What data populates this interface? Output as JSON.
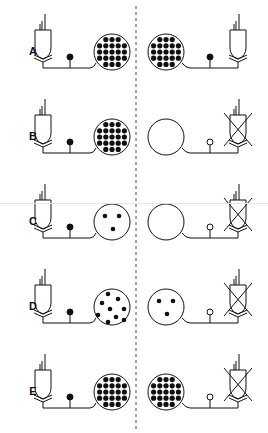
{
  "figure": {
    "colors": {
      "ink": "#111111",
      "divider": "#555555",
      "background": "#ffffff"
    },
    "divider": {
      "x": 136,
      "style": "dashed"
    },
    "rows": [
      {
        "label": "A",
        "y": 52,
        "left": {
          "cell_pattern": "dense",
          "synapse": "filled",
          "bulb": "intact"
        },
        "right": {
          "cell_pattern": "dense",
          "synapse": "filled",
          "bulb": "intact"
        }
      },
      {
        "label": "B",
        "y": 137,
        "left": {
          "cell_pattern": "dense",
          "synapse": "filled",
          "bulb": "intact"
        },
        "right": {
          "cell_pattern": "empty",
          "synapse": "open",
          "bulb": "crossed"
        }
      },
      {
        "label": "C",
        "y": 222,
        "left": {
          "cell_pattern": "three",
          "synapse": "filled",
          "bulb": "intact"
        },
        "right": {
          "cell_pattern": "empty",
          "synapse": "open",
          "bulb": "crossed"
        }
      },
      {
        "label": "D",
        "y": 307,
        "left": {
          "cell_pattern": "sparse",
          "synapse": "filled",
          "bulb": "intact"
        },
        "right": {
          "cell_pattern": "three",
          "synapse": "open",
          "bulb": "crossed"
        }
      },
      {
        "label": "E",
        "y": 392,
        "left": {
          "cell_pattern": "dense",
          "synapse": "filled",
          "bulb": "intact"
        },
        "right": {
          "cell_pattern": "dense",
          "synapse": "open",
          "bulb": "crossed"
        }
      }
    ]
  }
}
